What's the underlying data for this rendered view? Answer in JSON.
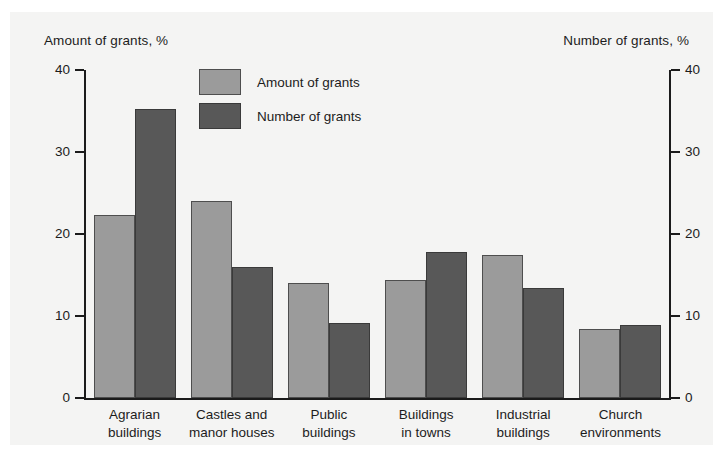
{
  "chart_data": {
    "type": "bar",
    "title": "",
    "categories": [
      "Agrarian\nbuildings",
      "Castles and\nmanor houses",
      "Public\nbuildings",
      "Buildings\nin towns",
      "Industrial\nbuildings",
      "Church\nenvironments"
    ],
    "series": [
      {
        "name": "Amount of grants",
        "color": "#9b9b9b",
        "values": [
          22.3,
          24.0,
          14.0,
          14.4,
          17.4,
          8.4
        ]
      },
      {
        "name": "Number of grants",
        "color": "#585858",
        "values": [
          35.2,
          16.0,
          9.2,
          17.8,
          13.4,
          8.9
        ]
      }
    ],
    "left_axis": {
      "label": "Amount of grants, %",
      "ticks": [
        0,
        10,
        20,
        30,
        40
      ],
      "ticklabels": [
        "0",
        "10",
        "20",
        "30",
        "40"
      ],
      "ylim": [
        0,
        40
      ]
    },
    "right_axis": {
      "label": "Number of grants, %",
      "ticks": [
        0,
        10,
        20,
        30,
        40
      ],
      "ticklabels": [
        "0",
        "10",
        "20",
        "30",
        "40"
      ],
      "ylim": [
        0,
        40
      ]
    },
    "xlabel": "",
    "ylabel": "Amount of grants, %",
    "grid": false,
    "legend_position": "upper center",
    "legend": [
      "Amount of grants",
      "Number of grants"
    ]
  },
  "colors": {
    "background": "#ffffff",
    "panel": "#f4f4f3",
    "axis": "#1b1b1b",
    "text": "#1c1c1c",
    "series_light": "#9b9b9b",
    "series_dark": "#585858"
  }
}
